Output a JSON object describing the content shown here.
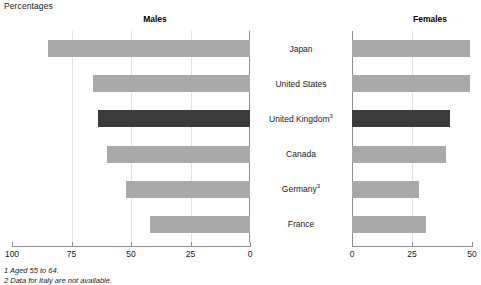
{
  "unit_label": "Percentages",
  "panels": {
    "males": {
      "heading": "Males",
      "axis": {
        "ticks": [
          100,
          75,
          50,
          25,
          0
        ],
        "tick_labels": [
          "100",
          "75",
          "50",
          "25",
          "0"
        ],
        "min": 0,
        "max": 100,
        "reversed": true
      }
    },
    "females": {
      "heading": "Females",
      "axis": {
        "ticks": [
          0,
          25,
          50
        ],
        "tick_labels": [
          "0",
          "25",
          "50"
        ],
        "min": 0,
        "max": 50,
        "reversed": false
      }
    }
  },
  "categories": [
    {
      "label": "Japan",
      "footnote_marker": ""
    },
    {
      "label": "United States",
      "footnote_marker": ""
    },
    {
      "label": "United Kingdom",
      "footnote_marker": "3"
    },
    {
      "label": "Canada",
      "footnote_marker": ""
    },
    {
      "label": "Germany",
      "footnote_marker": "3"
    },
    {
      "label": "France",
      "footnote_marker": ""
    }
  ],
  "footnotes": [
    "1 Aged 55 to 64.",
    "2 Data for Italy are not available."
  ],
  "colors": {
    "bar_default": "#a9a9a9",
    "bar_highlight": "#3b3b3b",
    "axis": "#8d8d8d",
    "gridline": "#e2e2e2",
    "text": "#1a1a1a",
    "background": "#ffffff"
  },
  "chart_data": {
    "type": "bar",
    "title": "",
    "subtitle": "",
    "xlabel": "Percentages",
    "ylabel": "",
    "orientation": "horizontal",
    "layout": "back-to-back population pyramid",
    "grid": true,
    "legend": null,
    "highlighted_category": "United Kingdom",
    "categories": [
      "Japan",
      "United States",
      "United Kingdom",
      "Canada",
      "Germany",
      "France"
    ],
    "series": [
      {
        "name": "Males",
        "panel": "left",
        "axis_reversed": true,
        "xlim": [
          0,
          100
        ],
        "xticks": [
          0,
          25,
          50,
          75,
          100
        ],
        "values": [
          85,
          66,
          64,
          60,
          52,
          42
        ]
      },
      {
        "name": "Females",
        "panel": "right",
        "axis_reversed": false,
        "xlim": [
          0,
          50
        ],
        "xticks": [
          0,
          25,
          50
        ],
        "values": [
          49,
          49,
          41,
          39,
          28,
          31
        ]
      }
    ]
  }
}
